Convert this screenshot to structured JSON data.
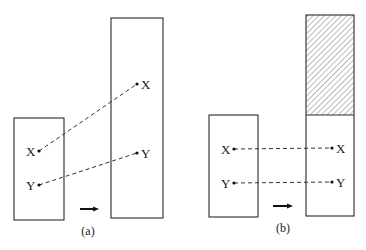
{
  "figure": {
    "panels": [
      {
        "caption": "(a)",
        "source_box": {
          "x": 14,
          "y": 118,
          "w": 50,
          "h": 102
        },
        "target_box": {
          "x": 111,
          "y": 18,
          "w": 52,
          "h": 200,
          "hatched_top_height": 0
        },
        "points": [
          {
            "label": "X",
            "from": [
              39,
              151
            ],
            "to": [
              137,
              84
            ]
          },
          {
            "label": "Y",
            "from": [
              39,
              185
            ],
            "to": [
              137,
              153
            ]
          }
        ],
        "arrow": {
          "x1": 80,
          "x2": 98,
          "y": 209
        }
      },
      {
        "caption": "(b)",
        "source_box": {
          "x": 209,
          "y": 115,
          "w": 49,
          "h": 102
        },
        "target_box": {
          "x": 306,
          "y": 15,
          "w": 48,
          "h": 201,
          "hatched_top_height": 100
        },
        "points": [
          {
            "label": "X",
            "from": [
              234,
              149
            ],
            "to": [
              332,
              148
            ]
          },
          {
            "label": "Y",
            "from": [
              234,
              183
            ],
            "to": [
              332,
              182
            ]
          }
        ],
        "arrow": {
          "x1": 273,
          "x2": 292,
          "y": 206
        }
      }
    ],
    "labels": {
      "a_src_x": "X",
      "a_src_y": "Y",
      "a_dst_x": "X",
      "a_dst_y": "Y",
      "b_src_x": "X",
      "b_src_y": "Y",
      "b_dst_x": "X",
      "b_dst_y": "Y",
      "caption_a": "(a)",
      "caption_b": "(b)"
    }
  }
}
